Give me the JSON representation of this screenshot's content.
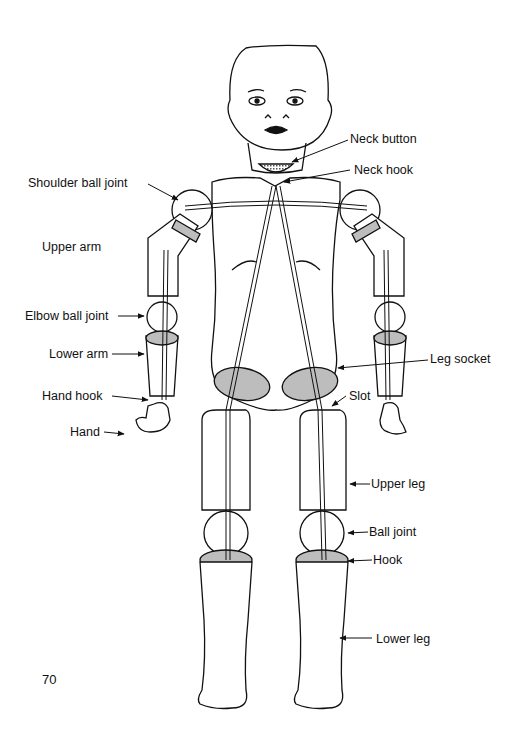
{
  "diagram": {
    "labels": {
      "neck_button": "Neck button",
      "neck_hook": "Neck hook",
      "shoulder_ball_joint": "Shoulder ball joint",
      "upper_arm": "Upper arm",
      "elbow_ball_joint": "Elbow ball joint",
      "lower_arm": "Lower arm",
      "leg_socket": "Leg socket",
      "hand_hook": "Hand hook",
      "hand": "Hand",
      "slot": "Slot",
      "upper_leg": "Upper leg",
      "ball_joint": "Ball joint",
      "hook": "Hook",
      "lower_leg": "Lower leg"
    },
    "colors": {
      "line": "#111111",
      "shade": "#bdbdbd",
      "background": "#ffffff"
    }
  },
  "page": {
    "number": "70"
  }
}
